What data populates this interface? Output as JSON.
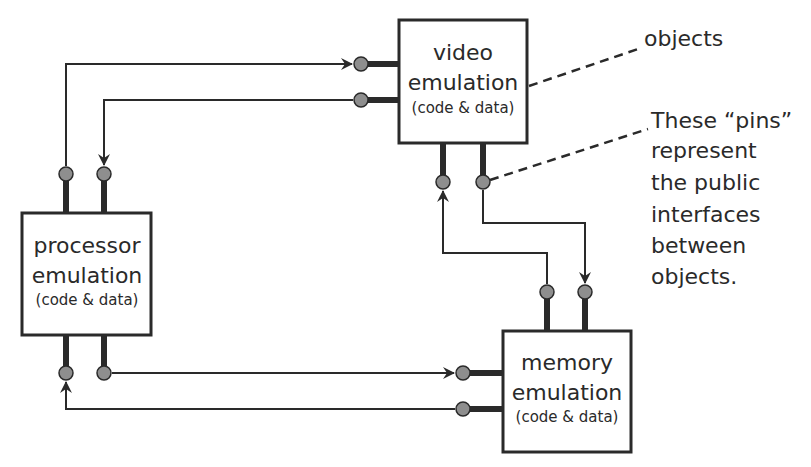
{
  "diagram": {
    "objects": {
      "video": {
        "line1": "video",
        "line2": "emulation",
        "line3": "(code & data)"
      },
      "processor": {
        "line1": "processor",
        "line2": "emulation",
        "line3": "(code & data)"
      },
      "memory": {
        "line1": "memory",
        "line2": "emulation",
        "line3": "(code & data)"
      }
    },
    "annotations": {
      "objects_label": "objects",
      "pins_note": [
        "These “pins”",
        "represent",
        "the public",
        "interfaces",
        "between",
        "objects."
      ]
    },
    "connections": [
      {
        "from": "processor.top-left",
        "to": "video.left-top"
      },
      {
        "from": "video.left-bottom",
        "to": "processor.top-right"
      },
      {
        "from": "processor.bottom-right",
        "to": "memory.left-top"
      },
      {
        "from": "memory.left-bottom",
        "to": "processor.bottom-left"
      },
      {
        "from": "video.bottom-right",
        "to": "memory.top-right"
      },
      {
        "from": "memory.top-left",
        "to": "video.bottom-left"
      }
    ],
    "colors": {
      "stroke": "#2a2a2a",
      "pin_fill": "#8e8e8e",
      "background": "#ffffff"
    }
  }
}
